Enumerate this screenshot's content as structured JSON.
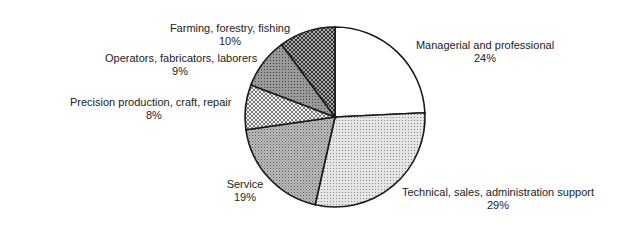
{
  "chart_data": {
    "type": "pie",
    "title": "",
    "start_angle_deg": 0,
    "direction": "clockwise",
    "slices": [
      {
        "label": "Managerial and professional",
        "value": 24,
        "display": "24%",
        "pattern": "white"
      },
      {
        "label": "Technical, sales, administration support",
        "value": 29,
        "display": "29%",
        "pattern": "light-dots"
      },
      {
        "label": "Service",
        "value": 19,
        "display": "19%",
        "pattern": "medium-dots"
      },
      {
        "label": "Precision production, craft, repair",
        "value": 8,
        "display": "8%",
        "pattern": "crosshatch-light"
      },
      {
        "label": "Operators, fabricators, laborers",
        "value": 9,
        "display": "9%",
        "pattern": "dark-gray"
      },
      {
        "label": "Farming, forestry, fishing",
        "value": 10,
        "display": "10%",
        "pattern": "crosshatch-dark"
      }
    ]
  }
}
